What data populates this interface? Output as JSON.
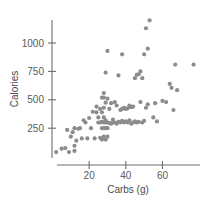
{
  "chart_data": {
    "type": "scatter",
    "title": "",
    "xlabel": "Carbs (g)",
    "ylabel": "Calories",
    "grid": false,
    "legend": null,
    "xlim": [
      0,
      80
    ],
    "ylim": [
      0,
      1220
    ],
    "xticks": [
      20,
      40,
      60
    ],
    "yticks": [
      250,
      500,
      750,
      1000
    ],
    "xtick_labels": [
      "20",
      "40",
      "60"
    ],
    "ytick_labels": [
      "250",
      "500",
      "750",
      "1000"
    ],
    "marker": {
      "shape": "circle",
      "color": "#8c8c8c",
      "radius_px": 2.1
    },
    "axis_color": "#6e6e6e",
    "background_color": "#ffffff",
    "n_points": 104,
    "points": [
      [
        2,
        40
      ],
      [
        5,
        70
      ],
      [
        7,
        75
      ],
      [
        8,
        235
      ],
      [
        9,
        40
      ],
      [
        10,
        175
      ],
      [
        11,
        215
      ],
      [
        12,
        50
      ],
      [
        12,
        95
      ],
      [
        12,
        250
      ],
      [
        13,
        140
      ],
      [
        14,
        245
      ],
      [
        15,
        250
      ],
      [
        16,
        160
      ],
      [
        17,
        320
      ],
      [
        18,
        300
      ],
      [
        19,
        160
      ],
      [
        20,
        340
      ],
      [
        21,
        250
      ],
      [
        22,
        395
      ],
      [
        23,
        160
      ],
      [
        24,
        390
      ],
      [
        24,
        440
      ],
      [
        25,
        300
      ],
      [
        25,
        345
      ],
      [
        26,
        165
      ],
      [
        26,
        300
      ],
      [
        26,
        420
      ],
      [
        27,
        150
      ],
      [
        27,
        250
      ],
      [
        27,
        305
      ],
      [
        27,
        390
      ],
      [
        27,
        520
      ],
      [
        28,
        175
      ],
      [
        28,
        250
      ],
      [
        28,
        300
      ],
      [
        28,
        345
      ],
      [
        28,
        430
      ],
      [
        28,
        520
      ],
      [
        28,
        560
      ],
      [
        29,
        150
      ],
      [
        29,
        250
      ],
      [
        29,
        300
      ],
      [
        29,
        320
      ],
      [
        29,
        475
      ],
      [
        29,
        740
      ],
      [
        30,
        175
      ],
      [
        30,
        250
      ],
      [
        30,
        300
      ],
      [
        30,
        510
      ],
      [
        30,
        930
      ],
      [
        31,
        295
      ],
      [
        31,
        420
      ],
      [
        32,
        290
      ],
      [
        32,
        470
      ],
      [
        33,
        300
      ],
      [
        33,
        325
      ],
      [
        34,
        300
      ],
      [
        34,
        480
      ],
      [
        35,
        290
      ],
      [
        35,
        450
      ],
      [
        36,
        305
      ],
      [
        36,
        715
      ],
      [
        37,
        300
      ],
      [
        37,
        410
      ],
      [
        38,
        315
      ],
      [
        38,
        420
      ],
      [
        38,
        900
      ],
      [
        39,
        300
      ],
      [
        39,
        430
      ],
      [
        40,
        310
      ],
      [
        40,
        420
      ],
      [
        41,
        300
      ],
      [
        41,
        425
      ],
      [
        42,
        320
      ],
      [
        42,
        450
      ],
      [
        43,
        290
      ],
      [
        43,
        435
      ],
      [
        44,
        300
      ],
      [
        44,
        440
      ],
      [
        45,
        310
      ],
      [
        45,
        690
      ],
      [
        46,
        300
      ],
      [
        46,
        720
      ],
      [
        47,
        305
      ],
      [
        47,
        725
      ],
      [
        48,
        480
      ],
      [
        48,
        750
      ],
      [
        49,
        300
      ],
      [
        49,
        690
      ],
      [
        50,
        315
      ],
      [
        50,
        900
      ],
      [
        51,
        430
      ],
      [
        51,
        1130
      ],
      [
        52,
        460
      ],
      [
        52,
        950
      ],
      [
        53,
        1200
      ],
      [
        55,
        345
      ],
      [
        56,
        470
      ],
      [
        57,
        310
      ],
      [
        60,
        490
      ],
      [
        62,
        480
      ],
      [
        64,
        640
      ],
      [
        65,
        605
      ],
      [
        66,
        410
      ],
      [
        67,
        810
      ],
      [
        68,
        585
      ],
      [
        77,
        810
      ]
    ]
  },
  "axis": {
    "x_title": "Carbs (g)",
    "y_title": "Calories"
  }
}
